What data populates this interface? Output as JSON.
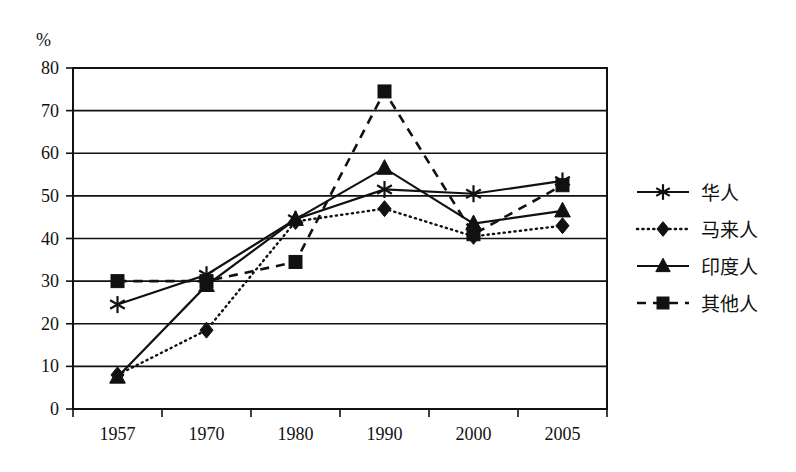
{
  "chart_data": {
    "type": "line",
    "title": "",
    "subtitle": "",
    "xlabel": "",
    "ylabel": "",
    "y_unit_label": "%",
    "categories": [
      "1957",
      "1970",
      "1980",
      "1990",
      "2000",
      "2005"
    ],
    "ylim": [
      0,
      80
    ],
    "y_ticks": [
      0,
      10,
      20,
      30,
      40,
      50,
      60,
      70,
      80
    ],
    "grid": "horizontal",
    "legend_position": "right",
    "series": [
      {
        "name": "华人",
        "marker": "asterisk",
        "line_style": "solid",
        "color": "#111111",
        "values": [
          24.5,
          31.5,
          44.5,
          51.5,
          50.5,
          53.5
        ]
      },
      {
        "name": "马来人",
        "marker": "diamond",
        "line_style": "dotted",
        "color": "#111111",
        "values": [
          8,
          18.5,
          44,
          47,
          40.5,
          43
        ]
      },
      {
        "name": "印度人",
        "marker": "triangle",
        "line_style": "solid",
        "color": "#111111",
        "values": [
          7.5,
          29,
          44.5,
          56.5,
          43.5,
          46.5
        ]
      },
      {
        "name": "其他人",
        "marker": "square",
        "line_style": "dashed",
        "color": "#111111",
        "values": [
          30,
          30,
          34.5,
          74.5,
          41,
          52.5
        ]
      }
    ]
  }
}
